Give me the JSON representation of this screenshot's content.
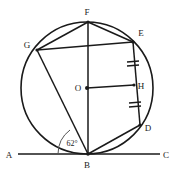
{
  "figure": {
    "stroke_color": "#1a1a1a",
    "fill_color": "none",
    "background": "#ffffff",
    "circle": {
      "center_label": "O",
      "cx": 87,
      "cy": 88,
      "r": 66
    },
    "points": [
      {
        "id": "F",
        "label": "F",
        "x": 88,
        "y": 22,
        "label_x": 87,
        "label_y": 15,
        "on_circle": true
      },
      {
        "id": "E",
        "label": "E",
        "x": 133,
        "y": 42,
        "label_x": 141,
        "label_y": 36,
        "on_circle": true
      },
      {
        "id": "H",
        "label": "H",
        "x": 133,
        "y": 86,
        "label_x": 141,
        "label_y": 89,
        "on_circle": false
      },
      {
        "id": "D",
        "label": "D",
        "x": 140,
        "y": 125,
        "label_x": 148,
        "label_y": 131,
        "on_circle": true
      },
      {
        "id": "B",
        "label": "B",
        "x": 88,
        "y": 154,
        "label_x": 87,
        "label_y": 168,
        "on_circle": true
      },
      {
        "id": "G",
        "label": "G",
        "x": 37,
        "y": 50,
        "label_x": 27,
        "label_y": 48,
        "on_circle": true
      },
      {
        "id": "O",
        "label": "O",
        "x": 87,
        "y": 88,
        "label_x": 78,
        "label_y": 91,
        "on_circle": false
      },
      {
        "id": "A",
        "label": "A",
        "x": 18,
        "y": 154,
        "label_x": 9,
        "label_y": 158,
        "on_circle": false
      },
      {
        "id": "C",
        "label": "C",
        "x": 160,
        "y": 154,
        "label_x": 166,
        "label_y": 158,
        "on_circle": false
      }
    ],
    "segments": [
      {
        "name": "tangent-line-AC",
        "from": "A",
        "to": "C"
      },
      {
        "name": "chord-GF",
        "from": "G",
        "to": "F"
      },
      {
        "name": "chord-FE",
        "from": "F",
        "to": "E"
      },
      {
        "name": "chord-GE",
        "from": "G",
        "to": "E"
      },
      {
        "name": "chord-GB",
        "from": "G",
        "to": "B"
      },
      {
        "name": "diameter-FB",
        "from": "F",
        "to": "B"
      },
      {
        "name": "chord-ED",
        "from": "E",
        "to": "D"
      },
      {
        "name": "chord-DB",
        "from": "D",
        "to": "B"
      },
      {
        "name": "radius-OH",
        "from": "O",
        "to": "H"
      }
    ],
    "tick_marks": [
      {
        "name": "tick-EH",
        "on_segment": "E-H",
        "x": 133,
        "y": 64,
        "count": 2
      },
      {
        "name": "tick-HD",
        "on_segment": "H-D",
        "x": 135,
        "y": 105,
        "count": 2
      }
    ],
    "angles": [
      {
        "name": "angle-at-B",
        "vertex": "B",
        "value": "62°",
        "label_x": 72,
        "label_y": 146,
        "arc_radius": 30
      }
    ]
  }
}
